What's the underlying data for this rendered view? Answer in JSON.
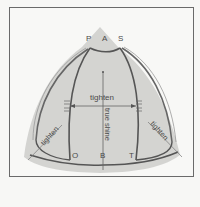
{
  "diagram": {
    "corner_labels_top": [
      "P",
      "A",
      "S"
    ],
    "corner_labels_bottom": [
      "O",
      "B",
      "T"
    ],
    "center_label": "tighten",
    "vertical_label": "true shine",
    "left_label": "tighten",
    "right_label": "tighten",
    "colors": {
      "shape_fill": "#cfcfcd",
      "frame_border": "#6a6a6a",
      "line": "#555555",
      "background": "#f8f8f6"
    }
  }
}
